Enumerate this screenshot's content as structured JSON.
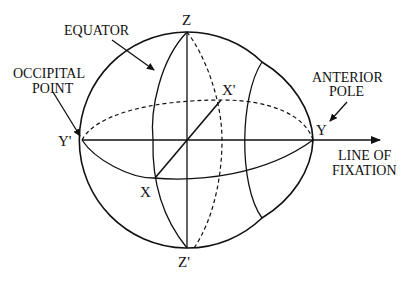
{
  "diagram": {
    "type": "eye-axes-diagram",
    "labels": {
      "equator": "EQUATOR",
      "occipital_line1": "OCCIPITAL",
      "occipital_line2": "POINT",
      "anterior_line1": "ANTERIOR",
      "anterior_line2": "POLE",
      "fixation_line1": "LINE OF",
      "fixation_line2": "FIXATION"
    },
    "points": {
      "z": "Z",
      "z_prime": "Z'",
      "y": "Y",
      "y_prime": "Y'",
      "x": "X",
      "x_prime": "X'"
    },
    "colors": {
      "line": "#111111",
      "background": "#ffffff"
    }
  }
}
